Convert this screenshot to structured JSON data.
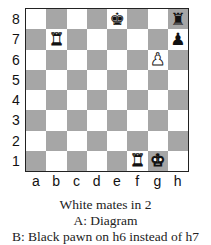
{
  "board": {
    "ranks": [
      "8",
      "7",
      "6",
      "5",
      "4",
      "3",
      "2",
      "1"
    ],
    "files": [
      "a",
      "b",
      "c",
      "d",
      "e",
      "f",
      "g",
      "h"
    ],
    "colors": {
      "light": "#ffffff",
      "dark": "#a6a6a6"
    },
    "pieces": [
      {
        "square": "e8",
        "color": "black",
        "type": "king",
        "glyph": "♚"
      },
      {
        "square": "h8",
        "color": "black",
        "type": "rook",
        "glyph": "♜"
      },
      {
        "square": "b7",
        "color": "white",
        "type": "rook",
        "glyph": "♜"
      },
      {
        "square": "h7",
        "color": "black",
        "type": "pawn",
        "glyph": "♟"
      },
      {
        "square": "g6",
        "color": "white",
        "type": "pawn",
        "glyph": "♟"
      },
      {
        "square": "f1",
        "color": "white",
        "type": "rook",
        "glyph": "♜"
      },
      {
        "square": "g1",
        "color": "white",
        "type": "king",
        "glyph": "♚"
      }
    ]
  },
  "caption": {
    "line1": "White mates in 2",
    "line2": "A: Diagram",
    "line3": "B: Black pawn on h6 instead of h7"
  }
}
